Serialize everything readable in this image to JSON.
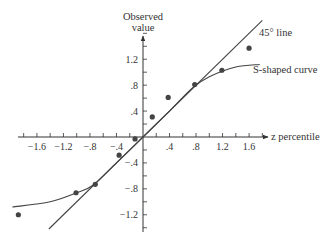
{
  "chart_data": {
    "type": "scatter",
    "title": "",
    "xlabel": "z percentile",
    "ylabel": "Observed value",
    "xlim": [
      -1.9,
      1.8
    ],
    "ylim": [
      -1.45,
      1.85
    ],
    "grid": false,
    "x_ticks": [
      -1.6,
      -1.2,
      -0.8,
      -0.4,
      0.4,
      0.8,
      1.2,
      1.6
    ],
    "x_tick_labels": [
      "−1.6",
      "−1.2",
      "−.8",
      "−.4",
      ".4",
      ".8",
      "1.2",
      "1.6"
    ],
    "y_ticks": [
      1.2,
      0.8,
      0.4,
      -0.4,
      -0.8,
      -1.2
    ],
    "y_tick_labels": [
      "1.2",
      ".8",
      ".4",
      "−.4",
      "−.8",
      "−1.2"
    ],
    "series": [
      {
        "name": "Observed data",
        "kind": "scatter",
        "x": [
          -1.88,
          -1.01,
          -0.72,
          -0.36,
          -0.12,
          0.14,
          0.38,
          0.78,
          1.19,
          1.6
        ],
        "y": [
          -1.2,
          -0.86,
          -0.73,
          -0.28,
          -0.03,
          0.31,
          0.61,
          0.81,
          1.03,
          1.37
        ]
      },
      {
        "name": "45° line",
        "kind": "line",
        "x": [
          -1.42,
          1.8
        ],
        "y": [
          -1.42,
          1.8
        ]
      },
      {
        "name": "S-shaped curve",
        "kind": "curve",
        "x": [
          -1.97,
          -1.4,
          -1.0,
          -0.75,
          -0.4,
          0,
          0.4,
          0.75,
          1.0,
          1.4,
          1.76
        ],
        "y": [
          -1.08,
          -1.0,
          -0.86,
          -0.74,
          -0.4,
          0,
          0.4,
          0.76,
          0.93,
          1.08,
          1.12
        ]
      }
    ],
    "annotations": [
      {
        "text": "45° line",
        "x": 1.75,
        "y": 1.7
      },
      {
        "text": "S-shaped curve",
        "x": 1.72,
        "y": 1.02
      }
    ],
    "legend": "none (inline annotations)"
  },
  "labels": {
    "y_axis_title_line1": "Observed",
    "y_axis_title_line2": "value",
    "x_axis_title": "z percentile",
    "line_annotation": "45° line",
    "curve_annotation": "S-shaped curve"
  },
  "colors": {
    "ink": "#333333",
    "points": "#444444",
    "background": "#ffffff"
  }
}
